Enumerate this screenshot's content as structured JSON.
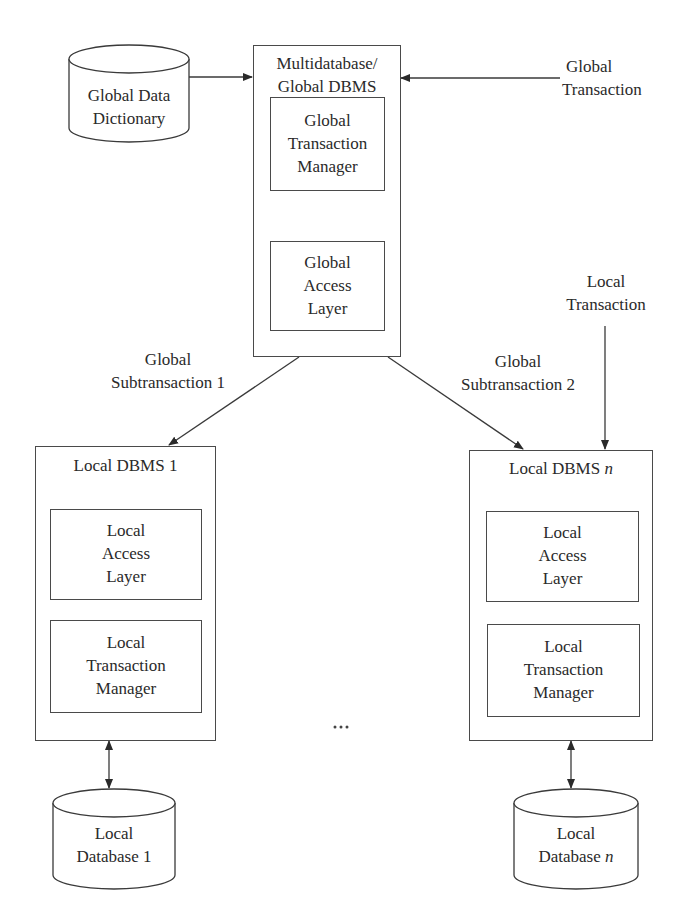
{
  "diagram": {
    "global_data_dictionary": {
      "line1": "Global Data",
      "line2": "Dictionary"
    },
    "global_dbms": {
      "title_line1": "Multidatabase/",
      "title_line2": "Global DBMS",
      "transaction_manager": [
        "Global",
        "Transaction",
        "Manager"
      ],
      "access_layer": [
        "Global",
        "Access",
        "Layer"
      ]
    },
    "global_transaction": {
      "line1": "Global",
      "line2": "Transaction"
    },
    "local_transaction": {
      "line1": "Local",
      "line2": "Transaction"
    },
    "subtransaction_1": {
      "line1": "Global",
      "line2": "Subtransaction 1"
    },
    "subtransaction_2": {
      "line1": "Global",
      "line2": "Subtransaction 2"
    },
    "local_dbms_1": {
      "title": "Local DBMS 1",
      "access_layer": [
        "Local",
        "Access",
        "Layer"
      ],
      "transaction_manager": [
        "Local",
        "Transaction",
        "Manager"
      ]
    },
    "local_dbms_n": {
      "title_prefix": "Local DBMS ",
      "title_var": "n",
      "access_layer": [
        "Local",
        "Access",
        "Layer"
      ],
      "transaction_manager": [
        "Local",
        "Transaction",
        "Manager"
      ]
    },
    "local_database_1": {
      "line1": "Local",
      "line2": "Database 1"
    },
    "local_database_n": {
      "line1": "Local",
      "line2_prefix": "Database ",
      "line2_var": "n"
    },
    "ellipsis": "..."
  }
}
